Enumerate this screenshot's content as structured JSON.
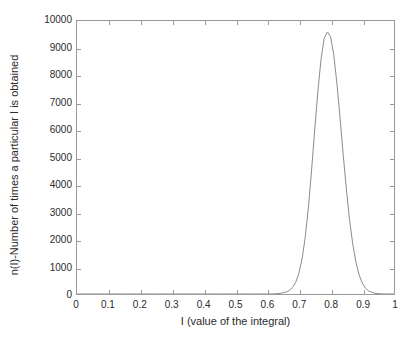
{
  "chart_data": {
    "type": "line",
    "title": "",
    "xlabel": "I (value of the integral)",
    "ylabel": "n(I)-Number of times a particular I is obtained",
    "xlim": [
      0,
      1
    ],
    "ylim": [
      0,
      10000
    ],
    "xticks": [
      0,
      0.1,
      0.2,
      0.3,
      0.4,
      0.5,
      0.6,
      0.7,
      0.8,
      0.9,
      1
    ],
    "xticklabels": [
      "0",
      "0.1",
      "0.2",
      "0.3",
      "0.4",
      "0.5",
      "0.6",
      "0.7",
      "0.8",
      "0.9",
      "1"
    ],
    "yticks": [
      0,
      1000,
      2000,
      3000,
      4000,
      5000,
      6000,
      7000,
      8000,
      9000,
      10000
    ],
    "yticklabels": [
      "0",
      "1000",
      "2000",
      "3000",
      "4000",
      "5000",
      "6000",
      "7000",
      "8000",
      "9000",
      "10000"
    ],
    "grid": false,
    "legend": false,
    "line_color": "#8c8c8c",
    "axis_color": "#9a9a9a",
    "background": "#ffffff",
    "peak": {
      "x": 0.79,
      "y": 9600
    },
    "series": [
      {
        "name": "n(I)",
        "x": [
          0.0,
          0.05,
          0.1,
          0.15,
          0.2,
          0.25,
          0.3,
          0.35,
          0.4,
          0.45,
          0.5,
          0.55,
          0.6,
          0.62,
          0.64,
          0.66,
          0.67,
          0.68,
          0.69,
          0.7,
          0.71,
          0.72,
          0.73,
          0.74,
          0.75,
          0.76,
          0.77,
          0.78,
          0.79,
          0.8,
          0.81,
          0.82,
          0.83,
          0.84,
          0.85,
          0.86,
          0.87,
          0.88,
          0.89,
          0.9,
          0.91,
          0.92,
          0.94,
          0.96,
          0.98,
          1.0
        ],
        "y": [
          0,
          0,
          0,
          0,
          0,
          0,
          0,
          0,
          0,
          0,
          0,
          0,
          0,
          5,
          20,
          70,
          130,
          240,
          430,
          760,
          1290,
          2080,
          3180,
          4540,
          6030,
          7440,
          8620,
          9380,
          9600,
          9420,
          8760,
          7700,
          6420,
          5080,
          3810,
          2700,
          1820,
          1160,
          700,
          400,
          215,
          110,
          25,
          5,
          0,
          0
        ]
      }
    ]
  }
}
